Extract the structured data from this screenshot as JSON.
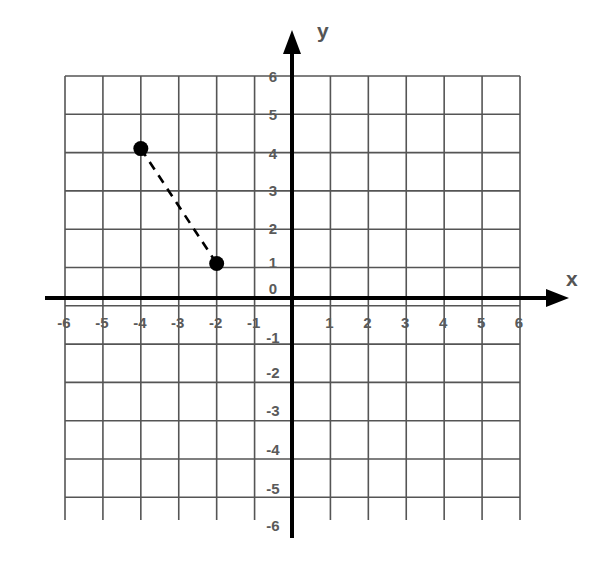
{
  "chart_data": {
    "type": "scatter",
    "title": "",
    "xlabel": "x",
    "ylabel": "y",
    "xlim": [
      -6,
      6
    ],
    "ylim": [
      -6,
      6
    ],
    "grid": true,
    "x_ticks": [
      "-6",
      "-5",
      "-4",
      "-3",
      "-2",
      "-1",
      "1",
      "2",
      "3",
      "4",
      "5",
      "6"
    ],
    "y_ticks": [
      "6",
      "5",
      "4",
      "3",
      "2",
      "1",
      "0",
      "-1",
      "-2",
      "-3",
      "-4",
      "-5",
      "-6"
    ],
    "series": [
      {
        "name": "points",
        "points": [
          {
            "x": -4,
            "y": 4
          },
          {
            "x": -2,
            "y": 1
          }
        ],
        "connector": "dashed"
      }
    ]
  },
  "colors": {
    "grid": "#555555",
    "axis": "#000000",
    "tick_text": "#5a5a5a",
    "point": "#000000"
  }
}
